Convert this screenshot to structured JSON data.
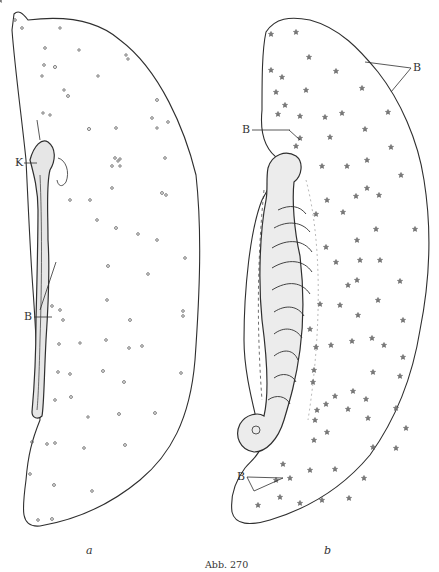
{
  "figure": {
    "caption": "Abb. 270",
    "panels": [
      {
        "id": "a",
        "letter": "a",
        "labels": [
          {
            "text": "K",
            "meaning": "annotation pointer near upper structure"
          },
          {
            "text": "B",
            "meaning": "annotation pointer on elongated central structure"
          }
        ]
      },
      {
        "id": "b",
        "letter": "b",
        "labels": [
          {
            "text": "B",
            "meaning": "annotation pointer to outer margin (top right)"
          },
          {
            "text": "B",
            "meaning": "annotation pointer to upper notch"
          },
          {
            "text": "B",
            "meaning": "annotation pointer at lower left of folded structure"
          }
        ]
      }
    ]
  },
  "colors": {
    "ink": "#2f2f2f",
    "stipple": "#8a8a8a",
    "paper": "#ffffff"
  }
}
